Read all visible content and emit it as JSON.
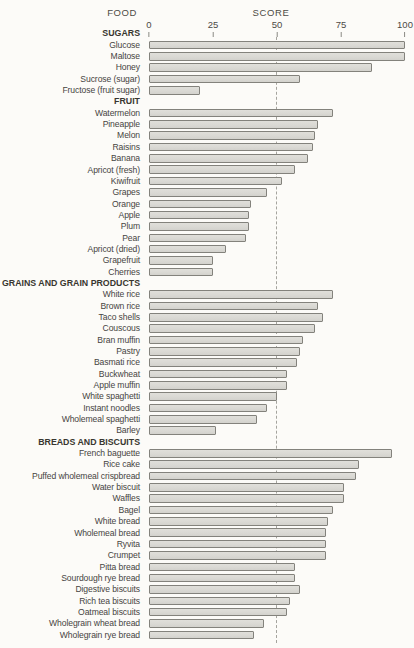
{
  "header": {
    "food_label": "FOOD",
    "score_label": "SCORE"
  },
  "axis": {
    "tick_labels": [
      "0",
      "25",
      "50",
      "75",
      "100"
    ],
    "tick_values": [
      0,
      25,
      50,
      75,
      100
    ],
    "min": 0,
    "max": 100,
    "reference_line_value": 50
  },
  "colors": {
    "background": "#fcfbf8",
    "bar_fill": "#d8d7d2",
    "bar_border": "#83827c",
    "text": "#46443f",
    "dashed_line": "#a5a49e"
  },
  "chart_data": {
    "type": "bar",
    "orientation": "horizontal",
    "title": "",
    "food_column_header": "FOOD",
    "score_column_header": "SCORE",
    "xlabel": "SCORE",
    "xlim": [
      0,
      100
    ],
    "x_ticks": [
      0,
      25,
      50,
      75,
      100
    ],
    "reference_line": 50,
    "grid": false,
    "legend": false,
    "groups": [
      {
        "category": "SUGARS",
        "items": [
          {
            "label": "Glucose",
            "value": 100
          },
          {
            "label": "Maltose",
            "value": 100
          },
          {
            "label": "Honey",
            "value": 87
          },
          {
            "label": "Sucrose (sugar)",
            "value": 59
          },
          {
            "label": "Fructose (fruit sugar)",
            "value": 20
          }
        ]
      },
      {
        "category": "FRUIT",
        "items": [
          {
            "label": "Watermelon",
            "value": 72
          },
          {
            "label": "Pineapple",
            "value": 66
          },
          {
            "label": "Melon",
            "value": 65
          },
          {
            "label": "Raisins",
            "value": 64
          },
          {
            "label": "Banana",
            "value": 62
          },
          {
            "label": "Apricot (fresh)",
            "value": 57
          },
          {
            "label": "Kiwifruit",
            "value": 52
          },
          {
            "label": "Grapes",
            "value": 46
          },
          {
            "label": "Orange",
            "value": 40
          },
          {
            "label": "Apple",
            "value": 39
          },
          {
            "label": "Plum",
            "value": 39
          },
          {
            "label": "Pear",
            "value": 38
          },
          {
            "label": "Apricot (dried)",
            "value": 30
          },
          {
            "label": "Grapefruit",
            "value": 25
          },
          {
            "label": "Cherries",
            "value": 25
          }
        ]
      },
      {
        "category": "GRAINS AND GRAIN PRODUCTS",
        "items": [
          {
            "label": "White rice",
            "value": 72
          },
          {
            "label": "Brown rice",
            "value": 66
          },
          {
            "label": "Taco shells",
            "value": 68
          },
          {
            "label": "Couscous",
            "value": 65
          },
          {
            "label": "Bran muffin",
            "value": 60
          },
          {
            "label": "Pastry",
            "value": 59
          },
          {
            "label": "Basmati rice",
            "value": 58
          },
          {
            "label": "Buckwheat",
            "value": 54
          },
          {
            "label": "Apple muffin",
            "value": 54
          },
          {
            "label": "White spaghetti",
            "value": 50
          },
          {
            "label": "Instant noodles",
            "value": 46
          },
          {
            "label": "Wholemeal spaghetti",
            "value": 42
          },
          {
            "label": "Barley",
            "value": 26
          }
        ]
      },
      {
        "category": "BREADS AND BISCUITS",
        "items": [
          {
            "label": "French baguette",
            "value": 95
          },
          {
            "label": "Rice cake",
            "value": 82
          },
          {
            "label": "Puffed wholemeal crispbread",
            "value": 81
          },
          {
            "label": "Water biscuit",
            "value": 76
          },
          {
            "label": "Waffles",
            "value": 76
          },
          {
            "label": "Bagel",
            "value": 72
          },
          {
            "label": "White bread",
            "value": 70
          },
          {
            "label": "Wholemeal bread",
            "value": 69
          },
          {
            "label": "Ryvita",
            "value": 69
          },
          {
            "label": "Crumpet",
            "value": 69
          },
          {
            "label": "Pitta bread",
            "value": 57
          },
          {
            "label": "Sourdough rye bread",
            "value": 57
          },
          {
            "label": "Digestive biscuits",
            "value": 59
          },
          {
            "label": "Rich tea biscuits",
            "value": 55
          },
          {
            "label": "Oatmeal biscuits",
            "value": 54
          },
          {
            "label": "Wholegrain wheat bread",
            "value": 45
          },
          {
            "label": "Wholegrain rye bread",
            "value": 41
          }
        ]
      }
    ]
  }
}
